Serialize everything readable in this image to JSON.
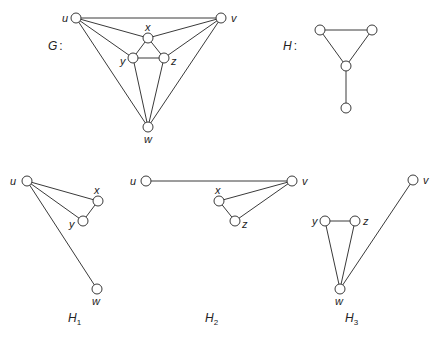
{
  "graphs": [
    {
      "id": "G",
      "title": "G",
      "title_suffix": ":",
      "title_pos": [
        48,
        50
      ],
      "nodes": [
        {
          "id": "u",
          "x": 76,
          "y": 18,
          "label": "u",
          "lx": 62,
          "ly": 22
        },
        {
          "id": "v",
          "x": 221,
          "y": 18,
          "label": "v",
          "lx": 231,
          "ly": 22
        },
        {
          "id": "x",
          "x": 148,
          "y": 38,
          "label": "x",
          "lx": 145,
          "ly": 31
        },
        {
          "id": "y",
          "x": 133,
          "y": 58,
          "label": "y",
          "lx": 120,
          "ly": 65
        },
        {
          "id": "z",
          "x": 164,
          "y": 58,
          "label": "z",
          "lx": 171,
          "ly": 65
        },
        {
          "id": "w",
          "x": 148,
          "y": 127,
          "label": "w",
          "lx": 144,
          "ly": 143
        }
      ],
      "edges": [
        [
          "u",
          "v"
        ],
        [
          "u",
          "x"
        ],
        [
          "u",
          "y"
        ],
        [
          "u",
          "w"
        ],
        [
          "v",
          "x"
        ],
        [
          "v",
          "z"
        ],
        [
          "v",
          "w"
        ],
        [
          "x",
          "y"
        ],
        [
          "x",
          "z"
        ],
        [
          "y",
          "z"
        ],
        [
          "y",
          "w"
        ],
        [
          "z",
          "w"
        ]
      ]
    },
    {
      "id": "H",
      "title": "H",
      "title_suffix": ":",
      "title_pos": [
        283,
        50
      ],
      "nodes": [
        {
          "id": "a",
          "x": 320,
          "y": 30,
          "label": ""
        },
        {
          "id": "b",
          "x": 372,
          "y": 30,
          "label": ""
        },
        {
          "id": "c",
          "x": 346,
          "y": 66,
          "label": ""
        },
        {
          "id": "d",
          "x": 346,
          "y": 108,
          "label": ""
        }
      ],
      "edges": [
        [
          "a",
          "b"
        ],
        [
          "a",
          "c"
        ],
        [
          "b",
          "c"
        ],
        [
          "c",
          "d"
        ]
      ]
    },
    {
      "id": "H1",
      "title": "H",
      "title_sub": "1",
      "title_pos": [
        68,
        322
      ],
      "nodes": [
        {
          "id": "u",
          "x": 27,
          "y": 181,
          "label": "u",
          "lx": 10,
          "ly": 185
        },
        {
          "id": "x",
          "x": 98,
          "y": 201,
          "label": "x",
          "lx": 94,
          "ly": 194
        },
        {
          "id": "y",
          "x": 83,
          "y": 221,
          "label": "y",
          "lx": 69,
          "ly": 228
        },
        {
          "id": "w",
          "x": 97,
          "y": 289,
          "label": "w",
          "lx": 92,
          "ly": 305
        }
      ],
      "edges": [
        [
          "u",
          "x"
        ],
        [
          "u",
          "y"
        ],
        [
          "u",
          "w"
        ],
        [
          "x",
          "y"
        ]
      ]
    },
    {
      "id": "H2",
      "title": "H",
      "title_sub": "2",
      "title_pos": [
        205,
        322
      ],
      "nodes": [
        {
          "id": "u",
          "x": 146,
          "y": 181,
          "label": "u",
          "lx": 130,
          "ly": 185
        },
        {
          "id": "v",
          "x": 292,
          "y": 181,
          "label": "v",
          "lx": 302,
          "ly": 185
        },
        {
          "id": "x",
          "x": 219,
          "y": 201,
          "label": "x",
          "lx": 215,
          "ly": 194
        },
        {
          "id": "z",
          "x": 235,
          "y": 221,
          "label": "z",
          "lx": 242,
          "ly": 228
        }
      ],
      "edges": [
        [
          "u",
          "v"
        ],
        [
          "v",
          "x"
        ],
        [
          "v",
          "z"
        ],
        [
          "x",
          "z"
        ]
      ]
    },
    {
      "id": "H3",
      "title": "H",
      "title_sub": "3",
      "title_pos": [
        345,
        322
      ],
      "nodes": [
        {
          "id": "y",
          "x": 325,
          "y": 221,
          "label": "y",
          "lx": 312,
          "ly": 225
        },
        {
          "id": "z",
          "x": 355,
          "y": 221,
          "label": "z",
          "lx": 363,
          "ly": 225
        },
        {
          "id": "w",
          "x": 340,
          "y": 289,
          "label": "w",
          "lx": 335,
          "ly": 305
        },
        {
          "id": "v",
          "x": 413,
          "y": 180,
          "label": "v",
          "lx": 423,
          "ly": 184
        }
      ],
      "edges": [
        [
          "y",
          "z"
        ],
        [
          "y",
          "w"
        ],
        [
          "z",
          "w"
        ],
        [
          "w",
          "v"
        ]
      ]
    }
  ],
  "style": {
    "node_radius": 5,
    "stroke": "#3a3a3a",
    "background": "#ffffff"
  }
}
